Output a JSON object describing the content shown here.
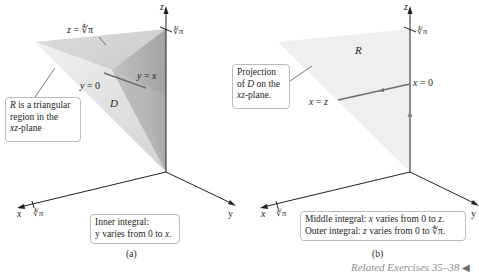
{
  "panel_a": {
    "caption": "(a)",
    "axes": {
      "x": "x",
      "y": "y",
      "z": "z"
    },
    "tick_z": "∜π",
    "tick_x": "∜π",
    "labels": {
      "top_surface": "z = ∜π",
      "y_equals_0": "y = 0",
      "y_equals_x": "y = x",
      "region": "D"
    },
    "callout_region": {
      "r": "R",
      "line1_rest": " is a triangular",
      "line2": "region in the",
      "line3_var": "xz",
      "line3_rest": "-plane"
    },
    "callout_inner": {
      "line1": "Inner integral:",
      "line2_pre": "y varies from 0 to ",
      "line2_var": "x",
      "line2_post": "."
    }
  },
  "panel_b": {
    "caption": "(b)",
    "axes": {
      "x": "x",
      "y": "y",
      "z": "z"
    },
    "tick_z": "∜π",
    "tick_x": "∜π",
    "labels": {
      "region": "R",
      "x_equals_0": "x = 0",
      "x_equals_z": "x = z"
    },
    "callout_projection": {
      "line1": "Projection",
      "line2_pre": "of ",
      "line2_var": "D",
      "line2_post": " on the",
      "line3_var": "xz",
      "line3_rest": "-plane."
    },
    "callout_outer": {
      "line1_pre": "Middle integral: ",
      "line1_var": "x",
      "line1_mid": " varies from 0 to ",
      "line1_var2": "z",
      "line1_post": ".",
      "line2_pre": "Outer integral: ",
      "line2_var": "z",
      "line2_mid": " varies from 0 to ",
      "line2_val": "∜π",
      "line2_post": "."
    }
  },
  "footer": {
    "related": "Related Exercises 35–38",
    "arrow_icon": "◀"
  },
  "colors": {
    "axis": "#231f20",
    "region_light": "#ececec",
    "region_mid": "#d4d4d4",
    "region_dark": "#a9a9a9",
    "projection_fill": "#efefef",
    "line_dark": "#6d6e71",
    "callout_border": "#b9bbbe",
    "related_text": "#8b8d90"
  }
}
